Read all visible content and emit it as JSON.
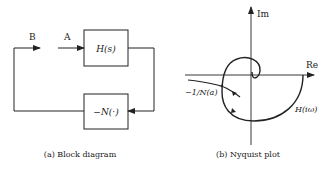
{
  "block_diagram": {
    "signal_b_label": "B",
    "signal_a_label": "A",
    "forward_block": "H(s)",
    "feedback_block": "−N(·)",
    "caption": "(a) Block diagram"
  },
  "nyquist_plot": {
    "re_axis_label": "Re",
    "im_axis_label": "Im",
    "describing_function_label": "−1/N(a)",
    "curve_label": "H(iω)",
    "caption": "(b) Nyquist plot"
  },
  "colors": {
    "stroke": "#222222",
    "background": "#ffffff"
  }
}
